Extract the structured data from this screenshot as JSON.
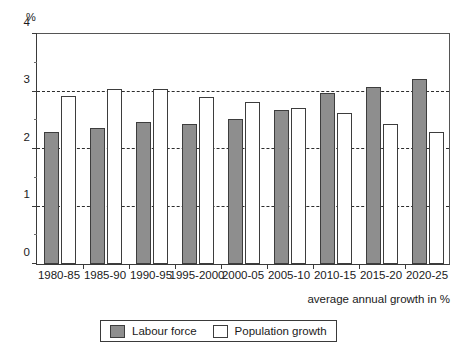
{
  "chart_data": {
    "type": "bar",
    "title": "",
    "subtitle": "",
    "xlabel": "average annual growth in %",
    "ylabel": "%",
    "ylim": [
      0,
      4
    ],
    "yticks": [
      0,
      1,
      2,
      3,
      4
    ],
    "ytick_labels": [
      "0",
      "1",
      "2",
      "3",
      "4"
    ],
    "minor_yticks": [
      0.5,
      1.5,
      2.5,
      3.5
    ],
    "grid": "horizontal-dashed-at-1-2-3",
    "legend_position": "bottom-center",
    "categories": [
      "1980-85",
      "1985-90",
      "1990-95",
      "1995-2000",
      "2000-05",
      "2005-10",
      "2010-15",
      "2015-20",
      "2020-25"
    ],
    "series": [
      {
        "name": "Labour force",
        "color": "#8e8e8e",
        "values": [
          2.3,
          2.37,
          2.47,
          2.43,
          2.52,
          2.67,
          2.97,
          3.07,
          3.22
        ]
      },
      {
        "name": "Population growth",
        "color": "#ffffff",
        "values": [
          2.92,
          3.05,
          3.04,
          2.91,
          2.81,
          2.71,
          2.62,
          2.44,
          2.29
        ]
      }
    ]
  },
  "axis": {
    "y_unit_label": "%",
    "x_caption": "average annual growth in %"
  },
  "legend": {
    "items": [
      {
        "label": "Labour force",
        "swatch": "filled-grey-swatch"
      },
      {
        "label": "Population growth",
        "swatch": "outlined-white-swatch"
      }
    ]
  }
}
